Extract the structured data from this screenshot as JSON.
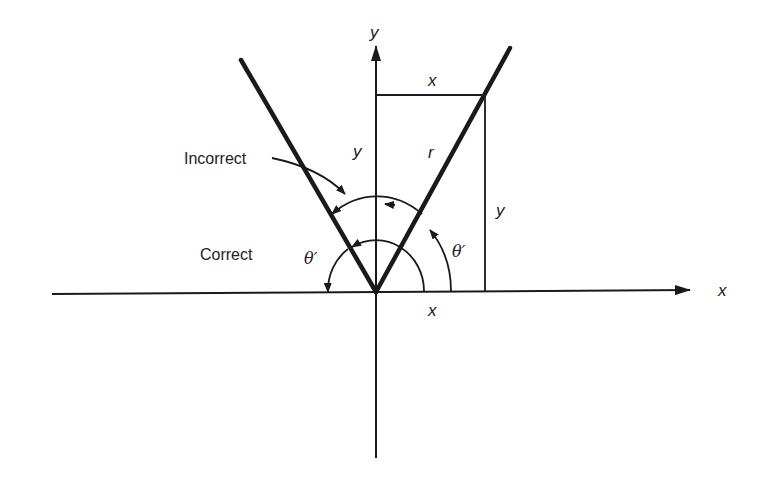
{
  "diagram": {
    "type": "reference-angle-diagram",
    "axes": {
      "x_label": "x",
      "y_label": "y"
    },
    "labels": {
      "incorrect": "Incorrect",
      "correct": "Correct",
      "theta_left": "θ′",
      "theta_right": "θ′",
      "r": "r",
      "rect_top_x": "x",
      "rect_bottom_x": "x",
      "rect_left_y": "y",
      "rect_right_y": "y"
    },
    "colors": {
      "stroke": "#1a1a1a",
      "background": "#ffffff"
    }
  }
}
